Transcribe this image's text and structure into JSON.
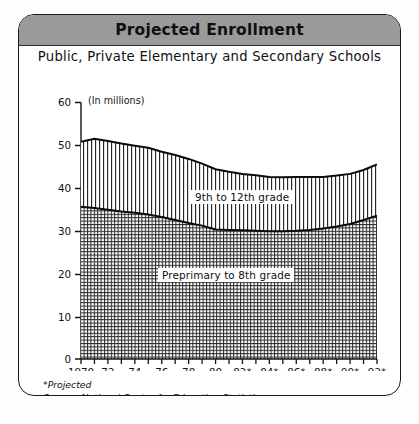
{
  "card": {
    "title": "Projected Enrollment",
    "subtitle": "Public, Private Elementary and Secondary Schools",
    "unit_note": "(In millions)",
    "footnote_projected": "*Projected",
    "footnote_source": "Source: National Center for Education Statistics",
    "title_bar_color": "#9a9a9a",
    "border_color": "#1b1b1b",
    "background_color": "#ffffff"
  },
  "chart_data": {
    "type": "area",
    "title": "Projected Enrollment",
    "subtitle": "Public, Private Elementary and Secondary Schools",
    "xlabel": "",
    "ylabel": "(In millions)",
    "ylim": [
      0,
      60
    ],
    "yticks": [
      0,
      10,
      20,
      30,
      40,
      50,
      60
    ],
    "ytick_labels": [
      "0",
      "10",
      "20",
      "30",
      "40",
      "50",
      "60"
    ],
    "xlim": [
      1970,
      1992
    ],
    "xticks": [
      1970,
      1971,
      1972,
      1973,
      1974,
      1975,
      1976,
      1977,
      1978,
      1979,
      1980,
      1981,
      1982,
      1983,
      1984,
      1985,
      1986,
      1987,
      1988,
      1989,
      1990,
      1991,
      1992
    ],
    "xtick_labels": [
      "1970",
      "",
      "72",
      "",
      "74",
      "",
      "76",
      "",
      "78",
      "",
      "80",
      "",
      "82*",
      "",
      "84*",
      "",
      "86*",
      "",
      "88*",
      "",
      "90*",
      "",
      "92*"
    ],
    "grid": false,
    "legend_position": "inline-labels",
    "stacked": true,
    "x": [
      1970,
      1971,
      1972,
      1973,
      1974,
      1975,
      1976,
      1977,
      1978,
      1979,
      1980,
      1981,
      1982,
      1983,
      1984,
      1985,
      1986,
      1987,
      1988,
      1989,
      1990,
      1991,
      1992
    ],
    "series": [
      {
        "name": "Preprimary to 8th grade",
        "fill_pattern": "cross-hatch",
        "values": [
          35.6,
          35.3,
          34.9,
          34.5,
          34.2,
          33.8,
          33.2,
          32.5,
          31.8,
          31.2,
          30.3,
          30.2,
          30.1,
          30.0,
          29.9,
          29.9,
          30.0,
          30.2,
          30.5,
          31.0,
          31.6,
          32.5,
          33.5
        ]
      },
      {
        "name": "9th to 12th grade",
        "fill_pattern": "vertical-lines",
        "values": [
          15.2,
          16.2,
          16.1,
          15.9,
          15.7,
          15.6,
          15.3,
          15.2,
          15.0,
          14.5,
          14.1,
          13.6,
          13.2,
          13.0,
          12.7,
          12.6,
          12.6,
          12.4,
          12.1,
          11.9,
          11.7,
          11.7,
          12.0
        ]
      }
    ],
    "totals": [
      50.8,
      51.5,
      51.0,
      50.4,
      49.9,
      49.4,
      48.5,
      47.7,
      46.8,
      45.7,
      44.4,
      43.8,
      43.3,
      43.0,
      42.6,
      42.5,
      42.6,
      42.6,
      42.6,
      42.9,
      43.3,
      44.2,
      45.5
    ],
    "annotations": [
      {
        "text": "9th to 12th grade",
        "x": 1981,
        "y": 46
      },
      {
        "text": "Preprimary to 8th grade",
        "x": 1980,
        "y": 27
      }
    ]
  }
}
